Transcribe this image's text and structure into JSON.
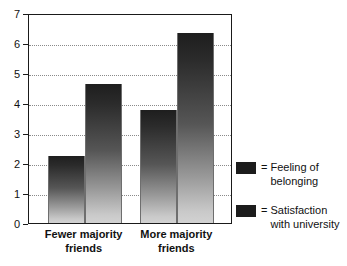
{
  "chart_data": {
    "type": "bar",
    "title": "",
    "xlabel": "",
    "ylabel": "",
    "ylim": [
      0,
      7
    ],
    "yticks": [
      "0",
      "1",
      "2",
      "3",
      "4",
      "5",
      "6",
      "7"
    ],
    "grid": true,
    "legend_position": "right",
    "categories": [
      "Fewer majority\nfriends",
      "More majority\nfriends"
    ],
    "series": [
      {
        "name": "= Feeling of\nbelonging",
        "legend_label": "= Feeling of\nbelonging",
        "color": "#1c1c1c",
        "values": [
          2.25,
          3.78
        ]
      },
      {
        "name": "= Satisfaction\nwith university",
        "legend_label": "= Satisfaction\nwith university",
        "color": "#1c1c1c",
        "values": [
          4.65,
          6.32
        ]
      }
    ]
  },
  "axis": {
    "ticks": [
      {
        "value": "7",
        "v": 7
      },
      {
        "value": "6",
        "v": 6
      },
      {
        "value": "5",
        "v": 5
      },
      {
        "value": "4",
        "v": 4
      },
      {
        "value": "3",
        "v": 3
      },
      {
        "value": "2",
        "v": 2
      },
      {
        "value": "1",
        "v": 1
      },
      {
        "value": "0",
        "v": 0
      }
    ]
  },
  "legend": {
    "equals_sign": "=",
    "items": [
      {
        "label": "Feeling of\nbelonging"
      },
      {
        "label": "Satisfaction\nwith university"
      }
    ]
  }
}
